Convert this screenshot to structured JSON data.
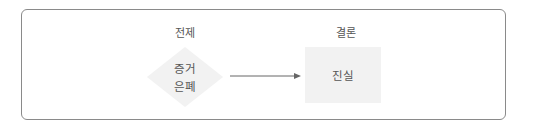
{
  "diagram": {
    "type": "flow",
    "labels": {
      "premise": "전제",
      "conclusion": "결론"
    },
    "nodes": [
      {
        "id": "evidence-concealment",
        "shape": "diamond",
        "lines": [
          "증거",
          "은폐"
        ],
        "fill": "#f2f2f2"
      },
      {
        "id": "truth",
        "shape": "rectangle",
        "text": "진실",
        "fill": "#f2f2f2"
      }
    ],
    "edges": [
      {
        "from": "evidence-concealment",
        "to": "truth",
        "style": "arrow",
        "color": "#666666"
      }
    ],
    "colors": {
      "border": "#8a8a8a",
      "node_fill": "#f2f2f2",
      "text": "#555555",
      "arrow": "#666666"
    }
  }
}
